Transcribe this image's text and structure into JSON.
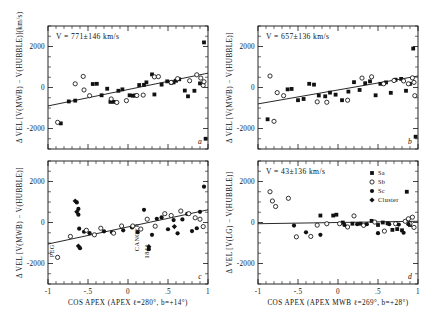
{
  "figure": {
    "title": "",
    "panels": [
      {
        "id": "a",
        "letter": "a",
        "note": "V = 771±146 km/s",
        "ylabel": "Δ VEL [V(MWB) − V(HUBBLE)]",
        "yunit": "(km/s)",
        "xlabel": "",
        "slope_fit": {
          "x1": -1.0,
          "y1": -900,
          "x2": 1.0,
          "y2": 700
        }
      },
      {
        "id": "b",
        "letter": "b",
        "note": "V = 657±136 km/s",
        "ylabel": "Δ VEL [V(MWB) − V(HUBBLE)]",
        "yunit": "",
        "xlabel": "",
        "slope_fit": {
          "x1": -1.0,
          "y1": -800,
          "x2": 1.0,
          "y2": 560
        }
      },
      {
        "id": "c",
        "letter": "c",
        "note": "",
        "ylabel": "Δ VEL [V(MWB) − V(HUBBLE)]",
        "yunit": "",
        "xlabel": "COS APEX (APEX ℓ=280°, b=+14°)",
        "slope_fit": {
          "x1": -1.0,
          "y1": -1050,
          "x2": 1.0,
          "y2": 620
        }
      },
      {
        "id": "d",
        "letter": "d",
        "note": "V = 43±136 km/s",
        "ylabel": "Δ VEL [V(LG) − V(HUBBLE)]",
        "yunit": "",
        "xlabel": "COS APEX (APEX MWB ℓ=269°, b=+28°)",
        "slope_fit": {
          "x1": -1.0,
          "y1": -60,
          "x2": 1.0,
          "y2": 60
        }
      }
    ],
    "axes": {
      "x": {
        "min": -1.0,
        "max": 1.0,
        "ticks": [
          -1,
          -0.5,
          0,
          0.5,
          1
        ],
        "ticklabels": [
          "-1",
          "-.5",
          "0",
          ".5",
          "1"
        ]
      },
      "y": {
        "min": -3000,
        "max": 3000,
        "ticks": [
          -2000,
          0,
          2000
        ],
        "ticklabels": [
          "-2000",
          "0",
          "2000"
        ]
      }
    },
    "annotations": [
      {
        "panel": "c",
        "text": "PEG",
        "x": -0.93,
        "y": -1700
      },
      {
        "panel": "c",
        "text": "CANCER",
        "x": 0.14,
        "y": -1400
      },
      {
        "panel": "c",
        "text": "1842",
        "x": 0.26,
        "y": -1750
      }
    ],
    "legend": {
      "panel": "d",
      "entries": [
        {
          "label": "Sa",
          "marker": "filled-square"
        },
        {
          "label": "Sb",
          "marker": "open-circle"
        },
        {
          "label": "Sc",
          "marker": "filled-circle"
        },
        {
          "label": "Cluster",
          "marker": "filled-diamond"
        }
      ]
    }
  },
  "chart_data": {
    "type": "scatter",
    "title": "",
    "xlabel": "COS APEX",
    "ylabel": "Δ VEL (km/s)",
    "xlim": [
      -1.0,
      1.0
    ],
    "ylim": [
      -3000,
      3000
    ],
    "grid": false,
    "legend_position": "upper-right-panel-d",
    "panels": [
      {
        "id": "a",
        "note": "V = 771±146 km/s",
        "ylabel": "Δ VEL [V(MWB) − V(HUBBLE)] (km/s)",
        "xlabel": "",
        "fit": {
          "intercept": -100,
          "slope": 800
        },
        "series": [
          {
            "name": "Sa",
            "marker": "filled-square",
            "points": [
              [
                -0.84,
                -1750
              ],
              [
                -0.74,
                -680
              ],
              [
                -0.66,
                -640
              ],
              [
                -0.44,
                170
              ],
              [
                -0.39,
                180
              ],
              [
                -0.33,
                -380
              ],
              [
                -0.26,
                -60
              ],
              [
                -0.22,
                -700
              ],
              [
                -0.18,
                -700
              ],
              [
                -0.12,
                -160
              ],
              [
                -0.07,
                -90
              ],
              [
                0.02,
                -380
              ],
              [
                0.06,
                -400
              ],
              [
                0.09,
                -390
              ],
              [
                0.14,
                120
              ],
              [
                0.2,
                130
              ],
              [
                0.23,
                250
              ],
              [
                0.3,
                640
              ],
              [
                0.33,
                -340
              ],
              [
                0.42,
                140
              ],
              [
                0.49,
                300
              ],
              [
                0.54,
                230
              ],
              [
                0.57,
                250
              ],
              [
                0.6,
                330
              ],
              [
                0.64,
                400
              ],
              [
                0.71,
                -150
              ],
              [
                0.75,
                -430
              ],
              [
                0.83,
                -160
              ],
              [
                0.9,
                200
              ],
              [
                0.95,
                2200
              ],
              [
                0.97,
                -2500
              ]
            ]
          },
          {
            "name": "Sb",
            "marker": "open-circle",
            "points": [
              [
                -0.88,
                -1700
              ],
              [
                -0.56,
                540
              ],
              [
                -0.66,
                180
              ],
              [
                -0.55,
                -120
              ],
              [
                -0.48,
                -400
              ],
              [
                -0.21,
                -560
              ],
              [
                -0.14,
                -730
              ],
              [
                -0.02,
                -640
              ],
              [
                0.11,
                -390
              ],
              [
                0.19,
                -370
              ],
              [
                0.33,
                520
              ],
              [
                0.38,
                530
              ],
              [
                0.54,
                250
              ],
              [
                0.62,
                430
              ],
              [
                0.77,
                330
              ],
              [
                0.86,
                620
              ],
              [
                0.91,
                460
              ],
              [
                0.94,
                100
              ],
              [
                0.95,
                280
              ]
            ]
          }
        ]
      },
      {
        "id": "b",
        "note": "V = 657±136 km/s",
        "ylabel": "Δ VEL [V(MWB) − V(HUBBLE)]",
        "xlabel": "",
        "fit": {
          "intercept": -120,
          "slope": 680
        },
        "series": [
          {
            "name": "Sa",
            "marker": "filled-square",
            "points": [
              [
                -0.88,
                -1550
              ],
              [
                -0.63,
                -90
              ],
              [
                -0.58,
                -70
              ],
              [
                -0.5,
                -620
              ],
              [
                -0.43,
                -560
              ],
              [
                -0.36,
                180
              ],
              [
                -0.3,
                140
              ],
              [
                -0.24,
                -390
              ],
              [
                -0.16,
                -430
              ],
              [
                -0.1,
                -250
              ],
              [
                -0.03,
                -350
              ],
              [
                0.05,
                -620
              ],
              [
                0.13,
                -200
              ],
              [
                0.2,
                260
              ],
              [
                0.27,
                -120
              ],
              [
                0.34,
                210
              ],
              [
                0.4,
                300
              ],
              [
                0.47,
                -380
              ],
              [
                0.53,
                180
              ],
              [
                0.6,
                250
              ],
              [
                0.66,
                -260
              ],
              [
                0.72,
                380
              ],
              [
                0.79,
                420
              ],
              [
                0.85,
                -160
              ],
              [
                0.9,
                180
              ],
              [
                0.94,
                1900
              ],
              [
                0.97,
                -2400
              ]
            ]
          },
          {
            "name": "Sb",
            "marker": "open-circle",
            "points": [
              [
                -0.85,
                560
              ],
              [
                -0.8,
                -1650
              ],
              [
                -0.76,
                -250
              ],
              [
                -0.68,
                -400
              ],
              [
                -0.26,
                -700
              ],
              [
                -0.14,
                -720
              ],
              [
                0.12,
                -620
              ],
              [
                0.3,
                460
              ],
              [
                0.42,
                520
              ],
              [
                0.57,
                180
              ],
              [
                0.7,
                340
              ],
              [
                0.82,
                320
              ],
              [
                0.88,
                180
              ],
              [
                0.93,
                470
              ],
              [
                0.95,
                250
              ],
              [
                0.96,
                -400
              ]
            ]
          }
        ]
      },
      {
        "id": "c",
        "note": "",
        "ylabel": "Δ VEL [V(MWB) − V(HUBBLE)]",
        "xlabel": "COS APEX (APEX ℓ=280°, b=+14°)",
        "fit": {
          "intercept": -200,
          "slope": 840
        },
        "series": [
          {
            "name": "Sc",
            "marker": "filled-circle",
            "points": [
              [
                -0.64,
                980
              ],
              [
                -0.62,
                660
              ],
              [
                -0.62,
                380
              ],
              [
                -0.61,
                -300
              ],
              [
                -0.6,
                -1250
              ],
              [
                -0.55,
                -450
              ],
              [
                -0.48,
                -520
              ],
              [
                -0.3,
                -430
              ],
              [
                -0.2,
                -480
              ],
              [
                -0.06,
                -380
              ],
              [
                0.05,
                -240
              ],
              [
                0.12,
                -470
              ],
              [
                0.2,
                620
              ],
              [
                0.26,
                -1300
              ],
              [
                0.3,
                -600
              ],
              [
                0.36,
                180
              ],
              [
                0.42,
                250
              ],
              [
                0.5,
                -330
              ],
              [
                0.57,
                120
              ],
              [
                0.62,
                -530
              ],
              [
                0.68,
                150
              ],
              [
                0.74,
                420
              ],
              [
                0.8,
                -420
              ],
              [
                0.86,
                -280
              ],
              [
                0.9,
                520
              ],
              [
                0.95,
                1750
              ]
            ]
          },
          {
            "name": "Sb",
            "marker": "open-circle",
            "points": [
              [
                -0.88,
                -1700
              ],
              [
                -0.72,
                -680
              ],
              [
                -0.52,
                -380
              ],
              [
                -0.42,
                -600
              ],
              [
                -0.34,
                -280
              ],
              [
                -0.18,
                -520
              ],
              [
                -0.08,
                -170
              ],
              [
                0.06,
                -170
              ],
              [
                0.16,
                -320
              ],
              [
                0.24,
                160
              ],
              [
                0.34,
                -180
              ],
              [
                0.46,
                430
              ],
              [
                0.54,
                340
              ],
              [
                0.66,
                560
              ],
              [
                0.76,
                430
              ],
              [
                0.84,
                230
              ],
              [
                0.9,
                160
              ],
              [
                0.94,
                -200
              ]
            ]
          },
          {
            "name": "Cluster",
            "marker": "filled-diamond",
            "points": [
              [
                -0.66,
                1050
              ],
              [
                -0.64,
                520
              ],
              [
                -0.62,
                -1150
              ],
              [
                0.26,
                -1180
              ],
              [
                0.58,
                -200
              ]
            ]
          }
        ]
      },
      {
        "id": "d",
        "note": "V = 43±136 km/s",
        "ylabel": "Δ VEL [V(LG) − V(HUBBLE)]",
        "xlabel": "COS APEX (APEX MWB ℓ=269°, b=+28°)",
        "fit": {
          "intercept": 0,
          "slope": 60
        },
        "series": [
          {
            "name": "Sa",
            "marker": "filled-square",
            "points": [
              [
                -0.22,
                340
              ],
              [
                -0.06,
                340
              ],
              [
                -0.02,
                380
              ],
              [
                0.06,
                0
              ],
              [
                0.18,
                -60
              ],
              [
                0.28,
                -60
              ],
              [
                0.42,
                80
              ],
              [
                0.5,
                -120
              ],
              [
                0.56,
                0
              ],
              [
                0.62,
                -40
              ],
              [
                0.68,
                -360
              ],
              [
                0.74,
                -320
              ],
              [
                0.8,
                -380
              ],
              [
                0.86,
                1500
              ],
              [
                0.9,
                -120
              ]
            ]
          },
          {
            "name": "Sb",
            "marker": "open-circle",
            "points": [
              [
                -0.85,
                1500
              ],
              [
                -0.82,
                1050
              ],
              [
                -0.78,
                780
              ],
              [
                -0.62,
                1180
              ],
              [
                -0.52,
                -700
              ],
              [
                -0.34,
                -680
              ],
              [
                -0.26,
                -130
              ],
              [
                -0.14,
                -60
              ],
              [
                0.02,
                -60
              ],
              [
                0.12,
                -220
              ],
              [
                0.2,
                320
              ],
              [
                0.32,
                -140
              ],
              [
                0.46,
                20
              ],
              [
                0.58,
                -420
              ],
              [
                0.72,
                -60
              ],
              [
                0.84,
                60
              ],
              [
                0.88,
                180
              ],
              [
                0.9,
                -60
              ],
              [
                0.93,
                260
              ],
              [
                0.95,
                -240
              ]
            ]
          },
          {
            "name": "Sc",
            "marker": "filled-circle",
            "points": [
              [
                -0.55,
                -150
              ],
              [
                -0.4,
                -480
              ],
              [
                -0.22,
                -600
              ],
              [
                0.08,
                -120
              ],
              [
                0.24,
                -80
              ],
              [
                0.36,
                -80
              ],
              [
                0.5,
                -520
              ],
              [
                0.64,
                -80
              ],
              [
                0.76,
                -100
              ],
              [
                0.82,
                -500
              ],
              [
                0.88,
                -80
              ]
            ]
          }
        ]
      }
    ]
  }
}
